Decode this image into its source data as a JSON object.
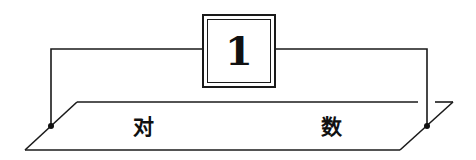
{
  "diagram": {
    "number_box": {
      "value": "1"
    },
    "plane": {
      "left_label": "对",
      "right_label": "数"
    },
    "colors": {
      "line": "#1a1a1a",
      "background": "#ffffff"
    }
  }
}
